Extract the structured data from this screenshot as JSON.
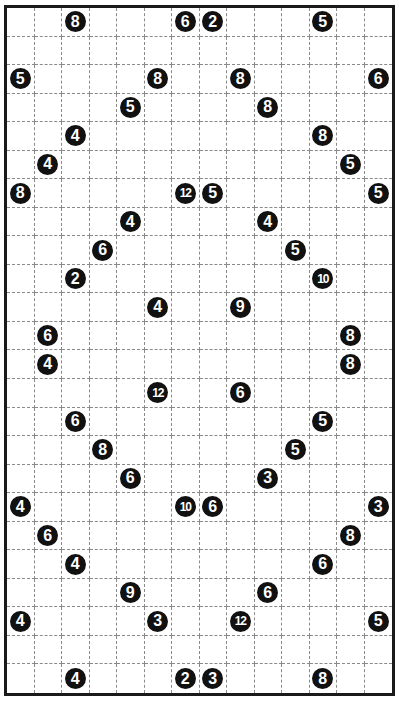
{
  "puzzle": {
    "cols": 14,
    "rows": 24,
    "colors": {
      "border": "#1a1a1a",
      "grid_line": "#8a8a8a",
      "clue_bg": "#111111",
      "clue_text": "#ffffff"
    },
    "clues": [
      {
        "r": 0,
        "c": 2,
        "v": "8"
      },
      {
        "r": 0,
        "c": 6,
        "v": "6"
      },
      {
        "r": 0,
        "c": 7,
        "v": "2"
      },
      {
        "r": 0,
        "c": 11,
        "v": "5"
      },
      {
        "r": 2,
        "c": 0,
        "v": "5"
      },
      {
        "r": 2,
        "c": 5,
        "v": "8"
      },
      {
        "r": 2,
        "c": 8,
        "v": "8"
      },
      {
        "r": 2,
        "c": 13,
        "v": "6"
      },
      {
        "r": 3,
        "c": 4,
        "v": "5"
      },
      {
        "r": 3,
        "c": 9,
        "v": "8"
      },
      {
        "r": 4,
        "c": 2,
        "v": "4"
      },
      {
        "r": 4,
        "c": 11,
        "v": "8"
      },
      {
        "r": 5,
        "c": 1,
        "v": "4"
      },
      {
        "r": 5,
        "c": 12,
        "v": "5"
      },
      {
        "r": 6,
        "c": 0,
        "v": "8"
      },
      {
        "r": 6,
        "c": 6,
        "v": "12"
      },
      {
        "r": 6,
        "c": 7,
        "v": "5"
      },
      {
        "r": 6,
        "c": 13,
        "v": "5"
      },
      {
        "r": 7,
        "c": 4,
        "v": "4"
      },
      {
        "r": 7,
        "c": 9,
        "v": "4"
      },
      {
        "r": 8,
        "c": 3,
        "v": "6"
      },
      {
        "r": 8,
        "c": 10,
        "v": "5"
      },
      {
        "r": 9,
        "c": 2,
        "v": "2"
      },
      {
        "r": 9,
        "c": 11,
        "v": "10"
      },
      {
        "r": 10,
        "c": 5,
        "v": "4"
      },
      {
        "r": 10,
        "c": 8,
        "v": "9"
      },
      {
        "r": 11,
        "c": 1,
        "v": "6"
      },
      {
        "r": 11,
        "c": 12,
        "v": "8"
      },
      {
        "r": 12,
        "c": 1,
        "v": "4"
      },
      {
        "r": 12,
        "c": 12,
        "v": "8"
      },
      {
        "r": 13,
        "c": 5,
        "v": "12"
      },
      {
        "r": 13,
        "c": 8,
        "v": "6"
      },
      {
        "r": 14,
        "c": 2,
        "v": "6"
      },
      {
        "r": 14,
        "c": 11,
        "v": "5"
      },
      {
        "r": 15,
        "c": 3,
        "v": "8"
      },
      {
        "r": 15,
        "c": 10,
        "v": "5"
      },
      {
        "r": 16,
        "c": 4,
        "v": "6"
      },
      {
        "r": 16,
        "c": 9,
        "v": "3"
      },
      {
        "r": 17,
        "c": 0,
        "v": "4"
      },
      {
        "r": 17,
        "c": 6,
        "v": "10"
      },
      {
        "r": 17,
        "c": 7,
        "v": "6"
      },
      {
        "r": 17,
        "c": 13,
        "v": "3"
      },
      {
        "r": 18,
        "c": 1,
        "v": "6"
      },
      {
        "r": 18,
        "c": 12,
        "v": "8"
      },
      {
        "r": 19,
        "c": 2,
        "v": "4"
      },
      {
        "r": 19,
        "c": 11,
        "v": "6"
      },
      {
        "r": 20,
        "c": 4,
        "v": "9"
      },
      {
        "r": 20,
        "c": 9,
        "v": "6"
      },
      {
        "r": 21,
        "c": 0,
        "v": "4"
      },
      {
        "r": 21,
        "c": 5,
        "v": "3"
      },
      {
        "r": 21,
        "c": 8,
        "v": "12"
      },
      {
        "r": 21,
        "c": 13,
        "v": "5"
      },
      {
        "r": 23,
        "c": 2,
        "v": "4"
      },
      {
        "r": 23,
        "c": 6,
        "v": "2"
      },
      {
        "r": 23,
        "c": 7,
        "v": "3"
      },
      {
        "r": 23,
        "c": 11,
        "v": "8"
      }
    ]
  }
}
